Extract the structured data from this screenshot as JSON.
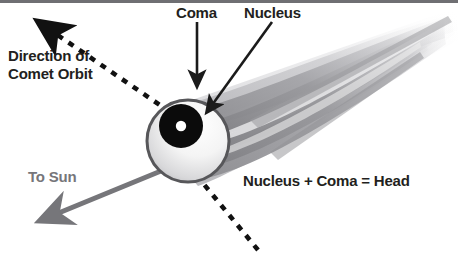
{
  "diagram": {
    "labels": {
      "direction": "Direction of\nComet Orbit",
      "direction_line1": "Direction of",
      "direction_line2": "Comet Orbit",
      "coma": "Coma",
      "nucleus": "Nucleus",
      "to_sun": "To Sun",
      "head_equation": "Nucleus + Coma = Head"
    },
    "colors": {
      "text": "#231f20",
      "to_sun_text": "#76767a",
      "to_sun_arrow": "#76767a",
      "coma_fill_light": "#fdfdfd",
      "coma_fill_dark": "#b9b9bc",
      "coma_outline": "#58585b",
      "nucleus_ring": "#0b0b0b",
      "nucleus_center": "#ffffff",
      "tail_dark": "#8b8b8f",
      "tail_mid": "#a8a8ac",
      "tail_light": "#cacacd",
      "tail_faint": "#e2e2e4",
      "orbit_dash": "#111111",
      "top_rule": "#6f6f73",
      "background": "#ffffff"
    },
    "elements": {
      "coma_circle": {
        "cx": 188,
        "cy": 141,
        "r": 41
      },
      "nucleus_ring": {
        "cx": 181,
        "cy": 126,
        "r_outer": 22,
        "r_inner": 5
      },
      "orbit_arrow": {
        "from_x": 258,
        "from_y": 250,
        "to_x": 36,
        "to_y": 21,
        "style": "dashed"
      },
      "sun_arrow": {
        "from_x": 176,
        "from_y": 166,
        "to_x": 36,
        "to_y": 224
      },
      "coma_pointer": {
        "from_x": 197,
        "from_y": 22,
        "to_x": 197,
        "to_y": 90
      },
      "nucleus_pointer": {
        "from_x": 271,
        "from_y": 22,
        "to_x": 205,
        "to_y": 115
      },
      "tail_tip": {
        "x": 452,
        "y": 22
      }
    }
  }
}
